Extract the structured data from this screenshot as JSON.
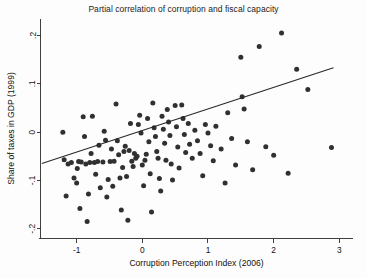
{
  "chart_data": {
    "type": "scatter",
    "title": "Partial correlation of corruption and fiscal capacity",
    "xlabel": "Corruption Perception Index (2006)",
    "ylabel": "Share of taxes in GDP (1999)",
    "xlim": [
      -1.55,
      3.2
    ],
    "ylim": [
      -0.22,
      0.235
    ],
    "xticks": [
      -1,
      0,
      1,
      2,
      3
    ],
    "xtick_labels": [
      "-1",
      "0",
      "1",
      "2",
      "3"
    ],
    "yticks": [
      0.2,
      0.1,
      0,
      -0.1,
      -0.2
    ],
    "ytick_labels": [
      ".2",
      ".1",
      "0",
      "-.1",
      "-.2"
    ],
    "grid": false,
    "legend": null,
    "marker_color": "#303030",
    "line_color": "#2a2a2a",
    "fit_line": {
      "x": [
        -1.53,
        2.91
      ],
      "y": [
        -0.065,
        0.133
      ]
    },
    "points": [
      [
        -1.21,
        0.0
      ],
      [
        -1.19,
        -0.057
      ],
      [
        -1.16,
        -0.132
      ],
      [
        -1.13,
        -0.066
      ],
      [
        -1.08,
        -0.063
      ],
      [
        -1.04,
        -0.095
      ],
      [
        -1.0,
        -0.105
      ],
      [
        -0.99,
        -0.075
      ],
      [
        -0.97,
        -0.061
      ],
      [
        -0.95,
        -0.158
      ],
      [
        -0.93,
        -0.062
      ],
      [
        -0.9,
        0.032
      ],
      [
        -0.88,
        -0.009
      ],
      [
        -0.86,
        -0.066
      ],
      [
        -0.84,
        -0.185
      ],
      [
        -0.82,
        -0.128
      ],
      [
        -0.8,
        -0.063
      ],
      [
        -0.78,
        -0.044
      ],
      [
        -0.76,
        0.033
      ],
      [
        -0.73,
        -0.063
      ],
      [
        -0.71,
        -0.087
      ],
      [
        -0.68,
        -0.061
      ],
      [
        -0.66,
        -0.027
      ],
      [
        -0.64,
        -0.115
      ],
      [
        -0.6,
        -0.062
      ],
      [
        -0.58,
        0.002
      ],
      [
        -0.56,
        -0.017
      ],
      [
        -0.54,
        -0.134
      ],
      [
        -0.52,
        -0.098
      ],
      [
        -0.49,
        -0.061
      ],
      [
        -0.47,
        -0.035
      ],
      [
        -0.45,
        -0.112
      ],
      [
        -0.43,
        -0.06
      ],
      [
        -0.4,
        0.058
      ],
      [
        -0.38,
        -0.018
      ],
      [
        -0.36,
        -0.047
      ],
      [
        -0.34,
        -0.095
      ],
      [
        -0.32,
        -0.161
      ],
      [
        -0.3,
        -0.073
      ],
      [
        -0.28,
        -0.04
      ],
      [
        -0.26,
        -0.029
      ],
      [
        -0.24,
        -0.092
      ],
      [
        -0.22,
        -0.182
      ],
      [
        -0.2,
        -0.038
      ],
      [
        -0.18,
        0.018
      ],
      [
        -0.16,
        -0.06
      ],
      [
        -0.14,
        -0.071
      ],
      [
        -0.12,
        -0.044
      ],
      [
        -0.1,
        -0.054
      ],
      [
        -0.08,
        -0.05
      ],
      [
        -0.06,
        0.016
      ],
      [
        -0.04,
        0.035
      ],
      [
        -0.02,
        -0.002
      ],
      [
        0.0,
        -0.068
      ],
      [
        0.02,
        -0.111
      ],
      [
        0.04,
        -0.058
      ],
      [
        0.06,
        -0.046
      ],
      [
        0.08,
        0.028
      ],
      [
        0.1,
        -0.02
      ],
      [
        0.12,
        -0.086
      ],
      [
        0.14,
        -0.165
      ],
      [
        0.16,
        0.06
      ],
      [
        0.18,
        0.009
      ],
      [
        0.2,
        -0.009
      ],
      [
        0.22,
        -0.04
      ],
      [
        0.24,
        -0.054
      ],
      [
        0.26,
        -0.096
      ],
      [
        0.28,
        -0.122
      ],
      [
        0.3,
        0.033
      ],
      [
        0.32,
        0.006
      ],
      [
        0.34,
        -0.023
      ],
      [
        0.36,
        -0.058
      ],
      [
        0.38,
        0.047
      ],
      [
        0.4,
        0.021
      ],
      [
        0.42,
        -0.007
      ],
      [
        0.44,
        -0.066
      ],
      [
        0.46,
        -0.099
      ],
      [
        0.5,
        0.055
      ],
      [
        0.52,
        0.011
      ],
      [
        0.54,
        -0.031
      ],
      [
        0.56,
        -0.074
      ],
      [
        0.6,
        0.056
      ],
      [
        0.62,
        0.028
      ],
      [
        0.64,
        -0.005
      ],
      [
        0.66,
        -0.042
      ],
      [
        0.7,
        0.018
      ],
      [
        0.72,
        -0.025
      ],
      [
        0.76,
        -0.054
      ],
      [
        0.8,
        0.004
      ],
      [
        0.84,
        -0.018
      ],
      [
        0.88,
        -0.044
      ],
      [
        0.92,
        -0.09
      ],
      [
        0.96,
        0.016
      ],
      [
        1.0,
        -0.002
      ],
      [
        1.04,
        -0.028
      ],
      [
        1.08,
        -0.059
      ],
      [
        1.12,
        0.012
      ],
      [
        1.2,
        -0.035
      ],
      [
        1.26,
        -0.105
      ],
      [
        1.3,
        0.04
      ],
      [
        1.36,
        -0.013
      ],
      [
        1.42,
        -0.068
      ],
      [
        1.5,
        0.155
      ],
      [
        1.52,
        0.073
      ],
      [
        1.55,
        0.048
      ],
      [
        1.6,
        -0.02
      ],
      [
        1.68,
        -0.078
      ],
      [
        1.78,
        0.177
      ],
      [
        1.88,
        -0.03
      ],
      [
        2.0,
        -0.048
      ],
      [
        2.12,
        0.205
      ],
      [
        2.22,
        -0.085
      ],
      [
        2.35,
        0.13
      ],
      [
        2.52,
        0.088
      ],
      [
        2.88,
        -0.032
      ]
    ]
  }
}
